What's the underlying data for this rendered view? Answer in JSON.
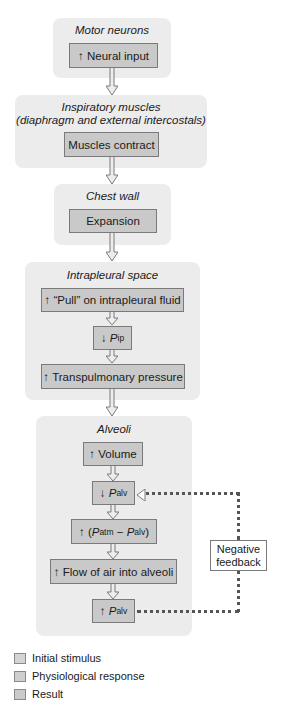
{
  "panels": {
    "motor": {
      "title": "Motor neurons"
    },
    "inspiratory": {
      "title_line1": "Inspiratory muscles",
      "title_line2": "(diaphragm and external intercostals)"
    },
    "chest": {
      "title": "Chest wall"
    },
    "intrapleural": {
      "title": "Intrapleural space"
    },
    "alveoli": {
      "title": "Alveoli"
    }
  },
  "boxes": {
    "neural_input": {
      "arrow": "↑",
      "text": "Neural input"
    },
    "muscles_contract": {
      "text": "Muscles contract"
    },
    "expansion": {
      "text": "Expansion"
    },
    "pull": {
      "arrow": "↑",
      "text": "“Pull” on intrapleural fluid"
    },
    "pip": {
      "arrow": "↓",
      "var": "P",
      "sub": "ip"
    },
    "transpulmonary": {
      "arrow": "↑",
      "text": "Transpulmonary pressure"
    },
    "volume": {
      "arrow": "↑",
      "text": "Volume"
    },
    "palv_down": {
      "arrow": "↓",
      "var": "P",
      "sub": "alv"
    },
    "patm_diff": {
      "arrow": "↑",
      "open": "(",
      "var1": "P",
      "sub1": "atm",
      "minus": " − ",
      "var2": "P",
      "sub2": "alv",
      "close": ")"
    },
    "flow": {
      "arrow": "↑",
      "text": "Flow of air into alveoli"
    },
    "palv_up": {
      "arrow": "↑",
      "var": "P",
      "sub": "alv"
    }
  },
  "feedback": {
    "line1": "Negative",
    "line2": "feedback"
  },
  "legend": [
    {
      "label": "Initial stimulus",
      "color": "#d4d4d4"
    },
    {
      "label": "Physiological response",
      "color": "#cfcfcf"
    },
    {
      "label": "Result",
      "color": "#cacaca"
    }
  ]
}
